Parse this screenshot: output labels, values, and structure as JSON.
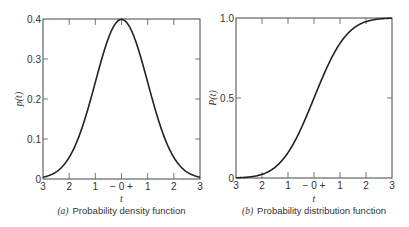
{
  "chart_data": [
    {
      "type": "line",
      "title": "(a) Probability density function",
      "caption_label": "(a)",
      "caption_text": "Probability density function",
      "xlabel": "t",
      "ylabel": "p(t)",
      "x_tick_labels": [
        "3",
        "2",
        "1",
        "− 0 +",
        "1",
        "2",
        "3"
      ],
      "x": [
        -3,
        -2.5,
        -2,
        -1.5,
        -1,
        -0.5,
        0,
        0.5,
        1,
        1.5,
        2,
        2.5,
        3
      ],
      "y_ticks": [
        0,
        0.1,
        0.2,
        0.3,
        0.4
      ],
      "y_tick_labels": [
        "0",
        "0.1",
        "0.2",
        "0.3",
        "0.4"
      ],
      "values": [
        0.004,
        0.018,
        0.054,
        0.13,
        0.242,
        0.352,
        0.399,
        0.352,
        0.242,
        0.13,
        0.054,
        0.018,
        0.004
      ],
      "xlim": [
        -3,
        3
      ],
      "ylim": [
        0,
        0.4
      ],
      "grid": false
    },
    {
      "type": "line",
      "title": "(b) Probability distribution function",
      "caption_label": "(b)",
      "caption_text": "Probability distribution function",
      "xlabel": "t",
      "ylabel": "P(t)",
      "x_tick_labels": [
        "3",
        "2",
        "1",
        "− 0 +",
        "1",
        "2",
        "3"
      ],
      "x": [
        -3,
        -2.5,
        -2,
        -1.5,
        -1,
        -0.5,
        0,
        0.5,
        1,
        1.5,
        2,
        2.5,
        3
      ],
      "y_ticks": [
        0,
        0.5,
        1.0
      ],
      "y_tick_labels": [
        "0",
        "0.5",
        "1.0"
      ],
      "values": [
        0.001,
        0.006,
        0.023,
        0.067,
        0.159,
        0.309,
        0.5,
        0.691,
        0.841,
        0.933,
        0.977,
        0.994,
        0.999
      ],
      "xlim": [
        -3,
        3
      ],
      "ylim": [
        0,
        1.0
      ],
      "grid": false
    }
  ]
}
